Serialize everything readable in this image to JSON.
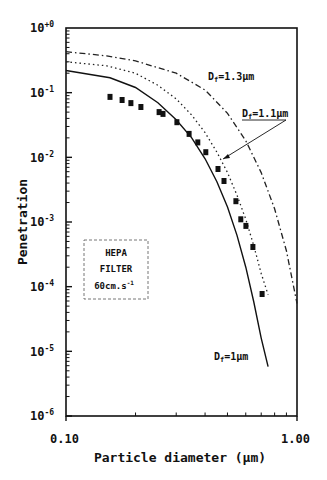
{
  "chart_data": {
    "type": "scatter",
    "title": "",
    "xlabel": "Particle diameter (µm)",
    "ylabel": "Penetration",
    "xscale": "log",
    "yscale": "log",
    "xlim": [
      0.1,
      1.0
    ],
    "ylim": [
      1e-06,
      1.0
    ],
    "x_tick_labels": [
      "0.10",
      "1.00"
    ],
    "y_tick_labels": [
      "10⁺⁰",
      "10⁻¹",
      "10⁻²",
      "10⁻³",
      "10⁻⁴",
      "10⁻⁵",
      "10⁻⁶"
    ],
    "grid": false,
    "series": [
      {
        "name": "Measured",
        "style": "square-markers",
        "x": [
          0.155,
          0.175,
          0.191,
          0.211,
          0.253,
          0.263,
          0.302,
          0.341,
          0.372,
          0.403,
          0.455,
          0.483,
          0.544,
          0.571,
          0.601,
          0.644,
          0.706
        ],
        "y": [
          0.086,
          0.077,
          0.069,
          0.06,
          0.05,
          0.047,
          0.035,
          0.023,
          0.017,
          0.012,
          0.0066,
          0.0043,
          0.0021,
          0.0011,
          0.00087,
          0.00041,
          7.7e-05
        ]
      },
      {
        "name": "Df=1µm",
        "style": "solid",
        "x": [
          0.1,
          0.155,
          0.2,
          0.25,
          0.3,
          0.35,
          0.4,
          0.45,
          0.5,
          0.55,
          0.6,
          0.65,
          0.7,
          0.75
        ],
        "y": [
          0.22,
          0.17,
          0.12,
          0.07,
          0.038,
          0.02,
          0.0095,
          0.0042,
          0.0017,
          0.00062,
          0.0002,
          5.8e-05,
          1.6e-05,
          5.8e-06
        ]
      },
      {
        "name": "Df=1.1µm",
        "style": "dotted",
        "x": [
          0.1,
          0.15,
          0.2,
          0.25,
          0.3,
          0.35,
          0.4,
          0.45,
          0.5,
          0.55,
          0.6,
          0.65,
          0.7,
          0.75
        ],
        "y": [
          0.3,
          0.26,
          0.2,
          0.13,
          0.08,
          0.045,
          0.024,
          0.012,
          0.0058,
          0.0026,
          0.0011,
          0.00043,
          0.00016,
          7.5e-05
        ]
      },
      {
        "name": "Df=1.3µm",
        "style": "dash-dot",
        "x": [
          0.1,
          0.15,
          0.2,
          0.3,
          0.4,
          0.5,
          0.6,
          0.7,
          0.8,
          0.9,
          1.0
        ],
        "y": [
          0.43,
          0.37,
          0.31,
          0.2,
          0.11,
          0.048,
          0.018,
          0.0058,
          0.0016,
          0.00036,
          5.5e-05
        ]
      }
    ],
    "annotations": [
      {
        "text": "Df=1.3µm",
        "target": "dash-dot curve"
      },
      {
        "text": "Df=1.1µm",
        "target": "dotted curve",
        "leader_line": true
      },
      {
        "text": "Df=1µm",
        "target": "solid curve"
      },
      {
        "text": "HEPA FILTER 60cm.s⁻¹",
        "boxed": true
      }
    ]
  },
  "labels": {
    "y_ticks": [
      "10",
      "10",
      "10",
      "10",
      "10",
      "10",
      "10"
    ],
    "y_exps": [
      "+0",
      "-1",
      "-2",
      "-3",
      "-4",
      "-5",
      "-6"
    ],
    "x_tick_left": "0.10",
    "x_tick_right": "1.00",
    "xlabel": "Particle diameter (µm)",
    "ylabel": "Penetration",
    "df13_base": "D",
    "df13_sub": "f",
    "df13_rest": "=1.3µm",
    "df11_base": "D",
    "df11_sub": "f",
    "df11_rest": "=1.1µm",
    "df1_base": "D",
    "df1_sub": "f",
    "df1_rest": "=1µm",
    "box_line1": "HEPA",
    "box_line2": "FILTER",
    "box_line3": "60cm.s",
    "box_line3_sup": "-1"
  }
}
